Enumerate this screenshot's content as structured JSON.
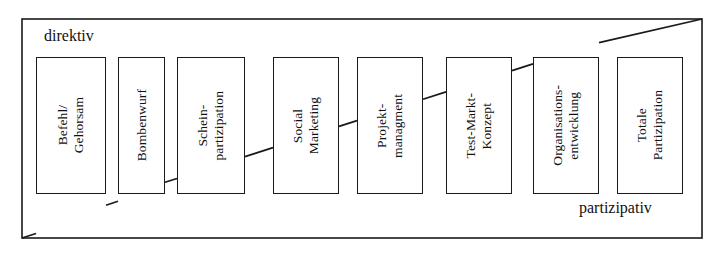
{
  "diagram": {
    "frame": {
      "x": 22,
      "y": 19,
      "width": 680,
      "height": 219,
      "stroke": "#1a1a1a"
    },
    "poles": {
      "left_label": "direktiv",
      "right_label": "partizipativ"
    },
    "wedge": {
      "description": "diagonal line from bottom-left corner of frame to top-right corner of frame",
      "start": [
        22,
        238
      ],
      "end": [
        702,
        19
      ]
    },
    "nodes": [
      {
        "id": "befehl-gehorsam",
        "label": "Befehl/\nGehorsam",
        "x": 36,
        "y": 57,
        "width": 70,
        "height": 137
      },
      {
        "id": "bombenwurf",
        "label": "Bombenwurf",
        "x": 118,
        "y": 57,
        "width": 47,
        "height": 137
      },
      {
        "id": "schein-partizipation",
        "label": "Schein-\npartizipation",
        "x": 177,
        "y": 57,
        "width": 68,
        "height": 137
      },
      {
        "id": "social-marketing",
        "label": "Social\nMarketing",
        "x": 273,
        "y": 57,
        "width": 66,
        "height": 137
      },
      {
        "id": "projekt-managment",
        "label": "Projekt-\nmanagment",
        "x": 357,
        "y": 57,
        "width": 66,
        "height": 137
      },
      {
        "id": "test-markt-konzept",
        "label": "Test-Markt-\nKonzept",
        "x": 446,
        "y": 57,
        "width": 66,
        "height": 137
      },
      {
        "id": "organisations-entwicklung",
        "label": "Organisations-\nentwicklung",
        "x": 533,
        "y": 57,
        "width": 66,
        "height": 137
      },
      {
        "id": "totale-partizipation",
        "label": "Totale\nPartizipation",
        "x": 617,
        "y": 57,
        "width": 66,
        "height": 137
      }
    ],
    "colors": {
      "line": "#1a1a1a",
      "background": "#ffffff",
      "text": "#111111"
    }
  }
}
